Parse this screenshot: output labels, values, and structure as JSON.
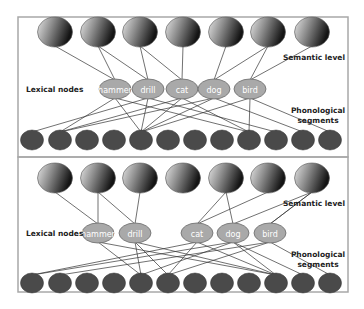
{
  "figure": {
    "panels": [
      {
        "id": "top",
        "labels": {
          "lexical": "Lexical nodes",
          "semantic": "Semantic level",
          "phonological_line1": "Phonological",
          "phonological_line2": "segments"
        },
        "semantic_nodes": [
          {
            "x": 55
          },
          {
            "x": 98
          },
          {
            "x": 140
          },
          {
            "x": 183
          },
          {
            "x": 226
          },
          {
            "x": 268
          },
          {
            "x": 312
          }
        ],
        "semantic_y": 32,
        "lexical_nodes": [
          {
            "word": "hammer",
            "x": 115
          },
          {
            "word": "drill",
            "x": 148
          },
          {
            "word": "cat",
            "x": 182
          },
          {
            "word": "dog",
            "x": 214
          },
          {
            "word": "bird",
            "x": 250
          }
        ],
        "lexical_y": 89,
        "phon_y": 140,
        "sem_links": [
          [
            0,
            0
          ],
          [
            1,
            0
          ],
          [
            1,
            1
          ],
          [
            2,
            1
          ],
          [
            2,
            2
          ],
          [
            3,
            2
          ],
          [
            4,
            3
          ],
          [
            5,
            3
          ],
          [
            5,
            4
          ],
          [
            6,
            4
          ]
        ],
        "phon_links": [
          [
            0,
            1
          ],
          [
            0,
            4
          ],
          [
            0,
            8
          ],
          [
            1,
            0
          ],
          [
            1,
            4
          ],
          [
            1,
            9
          ],
          [
            2,
            1
          ],
          [
            2,
            4
          ],
          [
            2,
            8
          ],
          [
            3,
            1
          ],
          [
            3,
            4
          ],
          [
            3,
            10
          ],
          [
            4,
            4
          ],
          [
            4,
            8
          ],
          [
            4,
            11
          ]
        ]
      },
      {
        "id": "bottom",
        "labels": {
          "lexical": "Lexical nodes",
          "semantic": "Semantic level",
          "phonological_line1": "Phonological",
          "phonological_line2": "segments"
        },
        "semantic_nodes": [
          {
            "x": 55
          },
          {
            "x": 98
          },
          {
            "x": 140
          },
          {
            "x": 183
          },
          {
            "x": 226
          },
          {
            "x": 268
          },
          {
            "x": 312
          }
        ],
        "semantic_y": 178,
        "lexical_nodes": [
          {
            "word": "hammer",
            "x": 98
          },
          {
            "word": "drill",
            "x": 135
          },
          {
            "word": "cat",
            "x": 197
          },
          {
            "word": "dog",
            "x": 233
          },
          {
            "word": "bird",
            "x": 270
          }
        ],
        "lexical_y": 233,
        "phon_y": 283,
        "sem_links": [
          [
            0,
            0
          ],
          [
            1,
            0
          ],
          [
            1,
            1
          ],
          [
            2,
            1
          ],
          [
            4,
            2
          ],
          [
            5,
            2
          ],
          [
            4,
            3
          ],
          [
            6,
            3
          ],
          [
            6,
            4
          ],
          [
            6,
            4
          ]
        ],
        "phon_links": [
          [
            0,
            4
          ],
          [
            0,
            9
          ],
          [
            1,
            4
          ],
          [
            1,
            5
          ],
          [
            1,
            9
          ],
          [
            2,
            0
          ],
          [
            2,
            5
          ],
          [
            2,
            9
          ],
          [
            3,
            0
          ],
          [
            3,
            4
          ],
          [
            3,
            9
          ],
          [
            3,
            10
          ],
          [
            4,
            1
          ],
          [
            4,
            5
          ],
          [
            4,
            11
          ]
        ]
      }
    ],
    "phon_x": [
      32,
      60,
      87,
      114,
      141,
      168,
      195,
      222,
      249,
      276,
      303,
      330
    ],
    "colors": {
      "frame": "#a8a8a8",
      "semantic_light": "#e8e8e8",
      "semantic_dark": "#1a1a1a",
      "lexical_fill": "#a9a9a9",
      "lexical_stroke": "#6a6a6a",
      "lexical_text": "#ffffff",
      "phon_fill": "#4a4a4a",
      "line": "#333333",
      "label": "#222222"
    }
  }
}
